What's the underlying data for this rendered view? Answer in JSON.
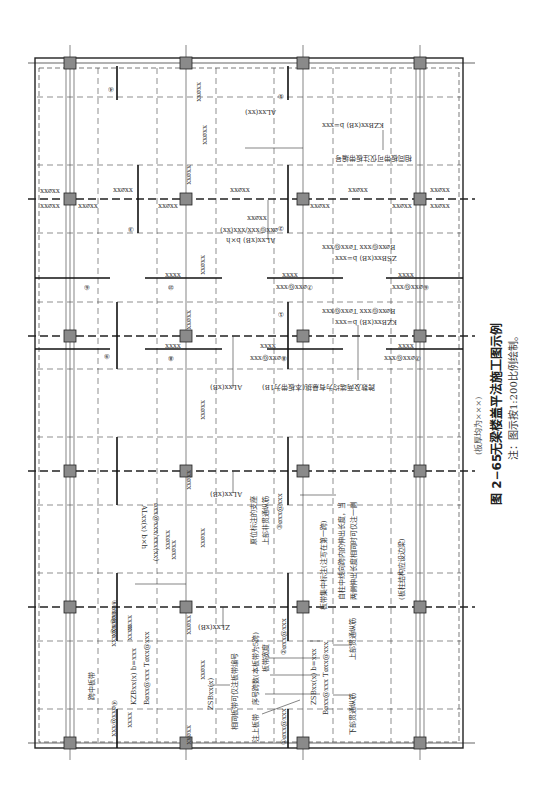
{
  "figure": {
    "number": "图 2−65",
    "title": "无梁楼盖平法施工图示例",
    "subtitle": "(板厚均为×××)",
    "note": "注：图示按1:200比例绘制。"
  },
  "grid": {
    "columns_x": [
      70,
      186,
      303,
      420
    ],
    "axes_y": [
      63,
      199,
      336,
      471,
      607,
      743
    ],
    "frame": {
      "x": 35,
      "y": 58,
      "w": 428,
      "h": 690
    }
  },
  "annotations": {
    "mid_strip": "跨中板带",
    "same_strip_number": "相同板带可仅注板带编号",
    "same_strip_number_top": "相同板带可仅注板带编号",
    "upper_strip_note": "注上板带",
    "seq_span": "序号跨数(本板带为5跨)",
    "strip_width": "板带宽度",
    "strip_mid_note": "板带集中标注(注写在第一跨)",
    "bottom_through": "下部贯通纵筋",
    "top_through": "上部贯通纵筋",
    "support_note_1": "原位标注的支座",
    "support_note_2": "上部非贯通纵筋",
    "extend_note_1": "自柱中线向跨内的伸出长度，当",
    "extend_note_2": "两侧伸出长度相同时可仅注一侧",
    "edge_beam": "(板柱结构应设边梁)",
    "span_same": "跨数及两端均为有悬挑(本板带为1B)",
    "KZB_lower": "KZBxx(x)  b=xxx",
    "KZB_lower_rebar": "B⌀xx@xxx  T⌀xx@xxx",
    "ZSB_lower": "ZSBxx(x)  b=xxx",
    "ZSB_lower_rebar": "B⌀xx@xxx  T⌀xx@xxx",
    "ZSB_mid": "ZSBxx(x)",
    "KZB_upper": "KZBxx(xB)  b=xxx",
    "KZB_upper_rebar": "B⌀xx@xxx  T⌀xx@xxx",
    "ZSB_upper": "ZSBxx(xB)  b=xxx",
    "ZSB_upper_rebar": "B⌀xx@xxx  T⌀xx@xxx",
    "KZB_top": "KZBxx(xB)  b=xxx",
    "AL_1": "ALxx(xx)",
    "AL_2": "ALxx(xB) b×h",
    "AL_2_rebar": "⌀xx@xxx/xxx(xx)",
    "AL_3": "ALxx(x)  b×h",
    "AL_3_rebar": "⌀xx@xxx/xxx(xx)",
    "AL_4": "ALxx(xB)",
    "AL_5": "ALxx(xB)",
    "ZL": "ZLxx(xB)",
    "rebar_short": "xx⌀xx",
    "rebar_1": "①⌀xx@xxx",
    "rebar_2": "②⌀xx@xxx",
    "rebar_3": "③⌀xx@xxx",
    "rebar_4": "④⌀xx@xxx",
    "rebar_5": "⑤⌀xx@xxx",
    "rebar_6": "⑥⌀xx@xxx",
    "rebar_7": "⑦⌀xx@xxx",
    "rebar_8": "⑧⌀xx@xxx",
    "len": "xxxx",
    "c1": "①",
    "c2": "②",
    "c3": "③",
    "c4": "④",
    "c5": "⑤",
    "c6": "⑥",
    "c7": "⑦",
    "c8": "⑧",
    "c9": "⑨",
    "c10": "⑩"
  }
}
